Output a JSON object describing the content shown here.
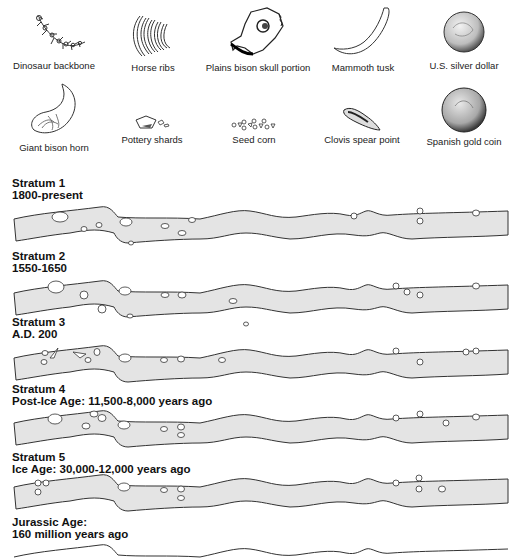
{
  "legend": {
    "items": [
      {
        "label": "Dinosaur backbone",
        "icon": "dinosaur-backbone-icon"
      },
      {
        "label": "Horse ribs",
        "icon": "horse-ribs-icon"
      },
      {
        "label": "Plains bison skull portion",
        "icon": "bison-skull-icon"
      },
      {
        "label": "Mammoth tusk",
        "icon": "mammoth-tusk-icon"
      },
      {
        "label": "U.S. silver dollar",
        "icon": "silver-dollar-icon"
      },
      {
        "label": "Giant bison horn",
        "icon": "bison-horn-icon"
      },
      {
        "label": "Pottery shards",
        "icon": "pottery-shards-icon"
      },
      {
        "label": "Seed corn",
        "icon": "seed-corn-icon"
      },
      {
        "label": "Clovis spear point",
        "icon": "spear-point-icon"
      },
      {
        "label": "Spanish gold coin",
        "icon": "gold-coin-icon"
      }
    ]
  },
  "strata": [
    {
      "title": "Stratum 1",
      "period": "1800-present"
    },
    {
      "title": "Stratum 2",
      "period": "1550-1650"
    },
    {
      "title": "Stratum 3",
      "period": "A.D. 200"
    },
    {
      "title": "Stratum 4",
      "period": "Post-Ice Age: 11,500-8,000 years ago"
    },
    {
      "title": "Stratum 5",
      "period": "Ice Age: 30,000-12,000 years ago"
    }
  ],
  "base_layer": {
    "title": "Jurassic Age:",
    "period": "160 million years ago"
  },
  "colors": {
    "band_fill": "#e4e4e4",
    "outline": "#333333",
    "text": "#111111"
  }
}
